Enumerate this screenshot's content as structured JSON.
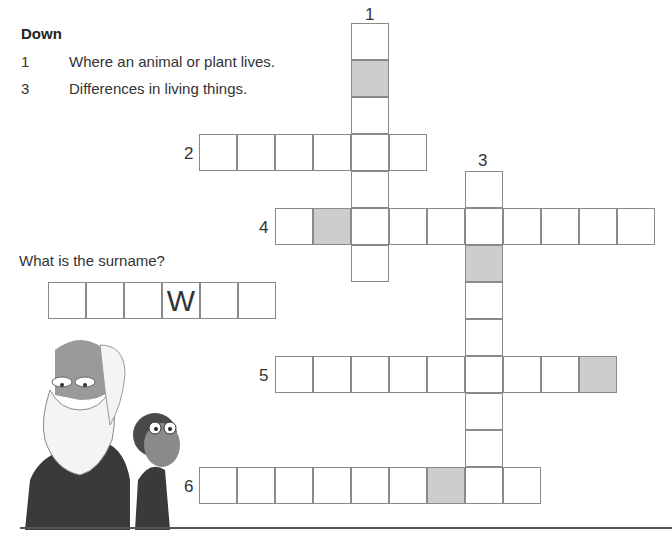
{
  "clues": {
    "heading": "Down",
    "down": [
      {
        "number": "1",
        "text": "Where an animal or plant lives."
      },
      {
        "number": "3",
        "text": "Differences in living things."
      }
    ]
  },
  "grid": {
    "labels": {
      "n1": "1",
      "n2": "2",
      "n3": "3",
      "n4": "4",
      "n5": "5",
      "n6": "6"
    },
    "entries": [
      {
        "id": "1-down",
        "length": 7,
        "shaded_indices": [
          1
        ]
      },
      {
        "id": "2-across",
        "length": 6,
        "shaded_indices": []
      },
      {
        "id": "3-down",
        "length": 9,
        "shaded_indices": [
          2
        ]
      },
      {
        "id": "4-across",
        "length": 10,
        "shaded_indices": [
          1
        ]
      },
      {
        "id": "5-across",
        "length": 9,
        "shaded_indices": [
          8
        ]
      },
      {
        "id": "6-across",
        "length": 9,
        "shaded_indices": [
          6
        ]
      }
    ],
    "shade_color": "#cdcdcd"
  },
  "surname": {
    "question": "What is the surname?",
    "letters": [
      "",
      "",
      "",
      "W",
      "",
      ""
    ]
  },
  "illustration": {
    "description": "Cartoon of Charles Darwin with a chimpanzee"
  }
}
